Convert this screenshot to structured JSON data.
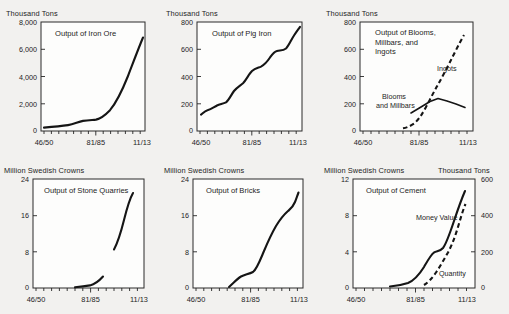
{
  "figure": {
    "background_color": "#f2f1ef",
    "ink_color": "#151515",
    "plot_background": "#fdfdfc"
  },
  "charts": [
    {
      "id": "iron-ore",
      "title": "Output of Iron Ore",
      "ylabel": "Thousand Tons",
      "yticks": [
        "0",
        "2,000",
        "4,000",
        "6,000",
        "8,000"
      ],
      "xticks": [
        "46/50",
        "81/85",
        "11/13"
      ],
      "ylim": [
        0,
        8000
      ],
      "series": [
        {
          "name": "Iron Ore",
          "style": "solid",
          "x": [
            0,
            1,
            2,
            3,
            4,
            5,
            6,
            7,
            8,
            9,
            10,
            11,
            12,
            13
          ],
          "y": [
            250,
            300,
            330,
            380,
            430,
            600,
            700,
            720,
            760,
            900,
            1500,
            2700,
            4500,
            6800
          ]
        }
      ]
    },
    {
      "id": "pig-iron",
      "title": "Output of Pig Iron",
      "ylabel": "Thousand Tons",
      "yticks": [
        "0",
        "200",
        "400",
        "600",
        "800"
      ],
      "xticks": [
        "46/50",
        "81/85",
        "11/13"
      ],
      "ylim": [
        0,
        800
      ],
      "series": [
        {
          "name": "Pig Iron",
          "style": "solid",
          "x": [
            0,
            1,
            2,
            3,
            4,
            5,
            6,
            7,
            8,
            9,
            10,
            11,
            12,
            13
          ],
          "y": [
            120,
            150,
            185,
            195,
            215,
            270,
            320,
            355,
            425,
            440,
            505,
            530,
            600,
            700
          ]
        }
      ]
    },
    {
      "id": "blooms-millbars-ingots",
      "title": "Output of Blooms, Millbars, and Ingots",
      "ylabel": "Thousand Tons",
      "yticks": [
        "0",
        "200",
        "400",
        "600",
        "800"
      ],
      "xticks": [
        "46/50",
        "81/85",
        "11/13"
      ],
      "ylim": [
        0,
        800
      ],
      "series": [
        {
          "name": "Ingots",
          "style": "dashed",
          "x": [
            5,
            6,
            7,
            8,
            9,
            10,
            11,
            12,
            13
          ],
          "y": [
            20,
            35,
            80,
            150,
            230,
            300,
            380,
            470,
            560
          ]
        },
        {
          "name": "Blooms and Millbars",
          "style": "solid",
          "x": [
            6,
            7,
            8,
            9,
            10,
            11,
            12,
            13
          ],
          "y": [
            130,
            175,
            215,
            235,
            215,
            195,
            180,
            165
          ]
        }
      ],
      "annotations": [
        "Ingots",
        "Blooms and Millbars"
      ]
    },
    {
      "id": "stone-quarries",
      "title": "Output of Stone Quarries",
      "ylabel": "Million Swedish Crowns",
      "yticks": [
        "0",
        "8",
        "16",
        "24"
      ],
      "xticks": [
        "46/50",
        "81/85",
        "11/13"
      ],
      "ylim": [
        0,
        24
      ],
      "series": [
        {
          "name": "Stone Quarries (early)",
          "style": "solid",
          "x": [
            5,
            6,
            7,
            8,
            9
          ],
          "y": [
            0.2,
            0.3,
            0.6,
            1.3,
            2.4
          ]
        },
        {
          "name": "Stone Quarries (late)",
          "style": "solid",
          "x": [
            10,
            11,
            12,
            13
          ],
          "y": [
            8.5,
            12.5,
            17.5,
            21.5
          ]
        }
      ]
    },
    {
      "id": "bricks",
      "title": "Output of Bricks",
      "ylabel": "Million Swedish Crowns",
      "yticks": [
        "0",
        "8",
        "16",
        "24"
      ],
      "xticks": [
        "46/50",
        "81/85",
        "11/13"
      ],
      "ylim": [
        0,
        24
      ],
      "series": [
        {
          "name": "Bricks",
          "style": "solid",
          "x": [
            5,
            6,
            7,
            8,
            9,
            10,
            11,
            12,
            13
          ],
          "y": [
            0.3,
            1.6,
            2.2,
            2.6,
            5.0,
            9.0,
            12.5,
            14.5,
            17.0
          ]
        }
      ]
    },
    {
      "id": "cement",
      "title": "Output of Cement",
      "ylabel": "Million Swedish Crowns",
      "ylabel_right": "Thousand Tons",
      "yticks": [
        "0",
        "4",
        "8",
        "12"
      ],
      "yticks_right": [
        "0",
        "200",
        "400",
        "600"
      ],
      "xticks": [
        "46/50",
        "81/85",
        "11/13"
      ],
      "ylim": [
        0,
        12
      ],
      "ylim_right": [
        0,
        600
      ],
      "series": [
        {
          "name": "Money Value",
          "style": "solid",
          "x": [
            5,
            6,
            7,
            8,
            9,
            10,
            11,
            12,
            13
          ],
          "y": [
            0.2,
            0.4,
            0.8,
            1.3,
            2.3,
            4.1,
            4.3,
            6.8,
            10.0
          ]
        },
        {
          "name": "Quantity",
          "style": "dashed",
          "x": [
            7,
            8,
            9,
            10,
            11,
            12,
            13
          ],
          "y": [
            0.3,
            0.7,
            1.3,
            2.0,
            3.0,
            5.2,
            8.5
          ]
        }
      ],
      "annotations": [
        "Money Value",
        "Quantity"
      ]
    }
  ]
}
